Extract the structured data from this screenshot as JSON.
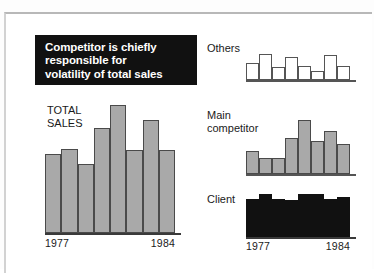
{
  "figure": {
    "title_lines": [
      "Competitor is chiefly",
      "responsible for",
      "volatility of total sales"
    ],
    "title_bg": "#111111",
    "title_fg": "#ffffff"
  },
  "labels": {
    "total_sales": "TOTAL\nSALES",
    "others": "Others",
    "main_competitor": "Main\ncompetitor",
    "client": "Client",
    "year_start": "1977",
    "year_end": "1984"
  },
  "chart_data": [
    {
      "type": "bar",
      "name": "total-sales",
      "title": "TOTAL SALES",
      "categories": [
        "1977",
        "1978",
        "1979",
        "1980",
        "1981",
        "1982",
        "1983",
        "1984"
      ],
      "values": [
        62,
        66,
        54,
        82,
        100,
        65,
        88,
        65
      ],
      "ylim": [
        0,
        100
      ],
      "xlabel": "",
      "ylabel": "",
      "tick_labels": [
        "1977",
        "1984"
      ],
      "grid": false,
      "legend": "none",
      "fill": "#a9a9a9",
      "stroke": "#4a4a4a"
    },
    {
      "type": "bar",
      "name": "others",
      "title": "Others",
      "categories": [
        "1977",
        "1978",
        "1979",
        "1980",
        "1981",
        "1982",
        "1983",
        "1984"
      ],
      "values": [
        62,
        92,
        48,
        82,
        50,
        33,
        88,
        50
      ],
      "ylim": [
        0,
        100
      ],
      "xlabel": "",
      "ylabel": "",
      "tick_labels": [],
      "grid": false,
      "legend": "none",
      "fill": "#ffffff",
      "stroke": "#555555"
    },
    {
      "type": "bar",
      "name": "main-competitor",
      "title": "Main competitor",
      "categories": [
        "1977",
        "1978",
        "1979",
        "1980",
        "1981",
        "1982",
        "1983",
        "1984"
      ],
      "values": [
        42,
        29,
        29,
        66,
        100,
        62,
        80,
        55
      ],
      "ylim": [
        0,
        100
      ],
      "xlabel": "",
      "ylabel": "",
      "tick_labels": [],
      "grid": false,
      "legend": "none",
      "fill": "#a9a9a9",
      "stroke": "#4a4a4a"
    },
    {
      "type": "bar",
      "name": "client",
      "title": "Client",
      "categories": [
        "1977",
        "1978",
        "1979",
        "1980",
        "1981",
        "1982",
        "1983",
        "1984"
      ],
      "values": [
        88,
        100,
        88,
        85,
        100,
        100,
        88,
        92
      ],
      "ylim": [
        0,
        100
      ],
      "xlabel": "",
      "ylabel": "",
      "tick_labels": [
        "1977",
        "1984"
      ],
      "grid": false,
      "legend": "none",
      "fill": "#111111",
      "stroke": "#111111"
    }
  ]
}
